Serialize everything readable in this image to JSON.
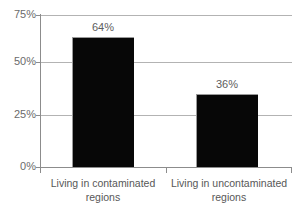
{
  "chart_data": {
    "type": "bar",
    "title": "",
    "subtitle": "",
    "xlabel": "",
    "ylabel": "",
    "categories": [
      "Living in contaminated regions",
      "Living in uncontaminated regions"
    ],
    "values": [
      64,
      36
    ],
    "data_labels": [
      "64%",
      "36%"
    ],
    "ylim": [
      0,
      75
    ],
    "ytick_values": [
      0,
      25,
      50,
      75
    ],
    "ytick_labels": [
      "0%",
      "25%",
      "50%",
      "75%"
    ],
    "grid": true,
    "grid_axis": "y",
    "legend": false,
    "legend_position": "none",
    "bar_color": "#070707",
    "gridline_color": "#b3b3b3",
    "axis_color": "#8c8c8c",
    "label_color": "#5d5d5d",
    "background_color": "#ffffff",
    "units": "percent"
  },
  "axis": {
    "y_ticks": [
      {
        "label": "75%",
        "value": 75
      },
      {
        "label": "50%",
        "value": 50
      },
      {
        "label": "25%",
        "value": 25
      },
      {
        "label": "0%",
        "value": 0
      }
    ]
  },
  "categories": [
    {
      "line1": "Living in contaminated",
      "line2": "regions",
      "value_label": "64%"
    },
    {
      "line1": "Living in uncontaminated",
      "line2": "regions",
      "value_label": "36%"
    }
  ]
}
